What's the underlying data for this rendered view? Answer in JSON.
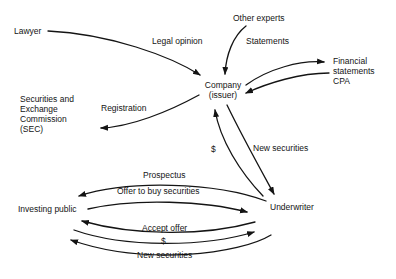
{
  "diagram": {
    "colors": {
      "ink": "#141414",
      "background": "#ffffff"
    },
    "nodes": {
      "lawyer": {
        "label": "Lawyer"
      },
      "other_experts": {
        "label": "Other experts"
      },
      "sec": {
        "label": "Securities and\nExchange\nCommission\n(SEC)"
      },
      "company": {
        "label": "Company\n(issuer)"
      },
      "cpa": {
        "label": "Financial\nstatements\nCPA"
      },
      "investing_public": {
        "label": "Investing public"
      },
      "underwriter": {
        "label": "Underwriter"
      }
    },
    "edges": [
      {
        "from": "lawyer",
        "to": "company",
        "label": "Legal opinion"
      },
      {
        "from": "other_experts",
        "to": "company",
        "label": "Statements"
      },
      {
        "from": "company",
        "to": "cpa",
        "label": ""
      },
      {
        "from": "cpa",
        "to": "company",
        "label": ""
      },
      {
        "from": "company",
        "to": "sec",
        "label": "Registration"
      },
      {
        "from": "underwriter",
        "to": "company",
        "label": "$"
      },
      {
        "from": "company",
        "to": "underwriter",
        "label": "New securities"
      },
      {
        "from": "underwriter",
        "to": "investing_public",
        "label": "Prospectus"
      },
      {
        "from": "investing_public",
        "to": "underwriter",
        "label": "Offer to buy securities"
      },
      {
        "from": "underwriter",
        "to": "investing_public",
        "label": "Accept offer"
      },
      {
        "from": "investing_public",
        "to": "underwriter",
        "label": "$"
      },
      {
        "from": "underwriter",
        "to": "investing_public",
        "label": "New securities"
      }
    ]
  }
}
